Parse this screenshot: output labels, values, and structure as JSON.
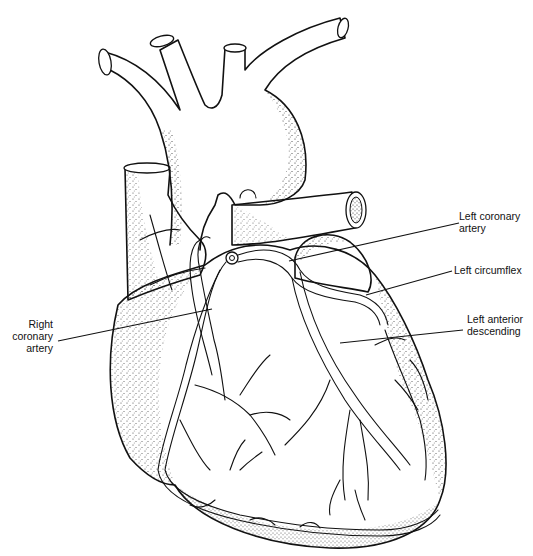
{
  "figure": {
    "style": "stippled pen-and-ink illustration",
    "colors": {
      "ink": "#111111",
      "background": "#ffffff"
    }
  },
  "labels": [
    {
      "id": "left-coronary-artery",
      "lines": [
        "Left coronary",
        "artery"
      ],
      "x": 459,
      "y": 216,
      "align": "left",
      "leader": [
        [
          459,
          223
        ],
        [
          289,
          261
        ]
      ]
    },
    {
      "id": "left-circumflex",
      "lines": [
        "Left circumflex"
      ],
      "x": 454,
      "y": 264,
      "align": "left",
      "leader": [
        [
          452,
          271
        ],
        [
          366,
          295
        ]
      ]
    },
    {
      "id": "left-anterior-descending",
      "lines": [
        "Left anterior",
        "descending"
      ],
      "x": 467,
      "y": 315,
      "align": "left",
      "leader": [
        [
          463,
          330
        ],
        [
          340,
          343
        ]
      ]
    },
    {
      "id": "right-coronary-artery",
      "lines": [
        "Right",
        "coronary",
        "artery"
      ],
      "x": 10,
      "y": 317,
      "align": "right",
      "leader": [
        [
          58,
          341
        ],
        [
          212,
          309
        ]
      ]
    }
  ]
}
